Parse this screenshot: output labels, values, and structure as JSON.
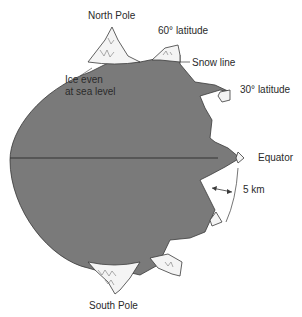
{
  "diagram": {
    "colors": {
      "land": "#7a7a7a",
      "ice": "#f4f4f4",
      "outline": "#3a3a3a",
      "text": "#2a2a2a"
    },
    "labels": {
      "north_pole": "North Pole",
      "south_pole": "South Pole",
      "lat60": "60° latitude",
      "lat30": "30° latitude",
      "equator": "Equator",
      "snow_line": "Snow line",
      "ice_sea_level_1": "Ice even",
      "ice_sea_level_2": "at sea level",
      "scale": "5 km"
    }
  }
}
